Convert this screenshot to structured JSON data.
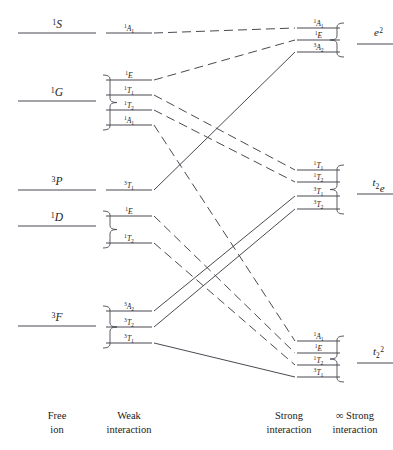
{
  "figure": {
    "line_color": "#4a4a52",
    "background": "#ffffff"
  },
  "captions": {
    "free_ion_l1": "Free",
    "free_ion_l2": "ion",
    "weak_l1": "Weak",
    "weak_l2": "interaction",
    "strong_l1": "Strong",
    "strong_l2": "interaction",
    "infinite_l1": "∞ Strong",
    "infinite_l2": "interaction"
  },
  "free_ion": [
    {
      "key": "S1",
      "mult": "1",
      "letter": "S",
      "label": "1S",
      "y": 33
    },
    {
      "key": "G1",
      "mult": "1",
      "letter": "G",
      "label": "1G",
      "y": 101
    },
    {
      "key": "P3",
      "mult": "3",
      "letter": "P",
      "label": "3P",
      "y": 190
    },
    {
      "key": "D1",
      "mult": "1",
      "letter": "D",
      "label": "1D",
      "y": 226
    },
    {
      "key": "F3",
      "mult": "3",
      "letter": "F",
      "label": "3F",
      "y": 326
    }
  ],
  "weak_field": [
    {
      "key": "w1",
      "mult": "1",
      "sym": "A",
      "sub": "1",
      "parent": "S1",
      "spin": "singlet",
      "y": 33
    },
    {
      "key": "w2",
      "mult": "1",
      "sym": "E",
      "sub": "",
      "parent": "G1",
      "spin": "singlet",
      "y": 80
    },
    {
      "key": "w3",
      "mult": "1",
      "sym": "T",
      "sub": "1",
      "parent": "G1",
      "spin": "singlet",
      "y": 95
    },
    {
      "key": "w4",
      "mult": "1",
      "sym": "T",
      "sub": "2",
      "parent": "G1",
      "spin": "singlet",
      "y": 110
    },
    {
      "key": "w5",
      "mult": "1",
      "sym": "A",
      "sub": "1",
      "parent": "G1",
      "spin": "singlet",
      "y": 125
    },
    {
      "key": "w6",
      "mult": "3",
      "sym": "T",
      "sub": "1",
      "parent": "P3",
      "spin": "triplet",
      "y": 190
    },
    {
      "key": "w7",
      "mult": "1",
      "sym": "E",
      "sub": "",
      "parent": "D1",
      "spin": "singlet",
      "y": 216
    },
    {
      "key": "w8",
      "mult": "1",
      "sym": "T",
      "sub": "2",
      "parent": "D1",
      "spin": "singlet",
      "y": 243
    },
    {
      "key": "w9",
      "mult": "3",
      "sym": "A",
      "sub": "2",
      "parent": "F3",
      "spin": "triplet",
      "y": 311
    },
    {
      "key": "w10",
      "mult": "3",
      "sym": "T",
      "sub": "2",
      "parent": "F3",
      "spin": "triplet",
      "y": 327
    },
    {
      "key": "w11",
      "mult": "3",
      "sym": "T",
      "sub": "1",
      "parent": "F3",
      "spin": "triplet",
      "y": 343
    }
  ],
  "strong_field": [
    {
      "key": "s1",
      "mult": "1",
      "sym": "A",
      "sub": "1",
      "config": "e2",
      "spin": "singlet",
      "y": 28
    },
    {
      "key": "s2",
      "mult": "1",
      "sym": "E",
      "sub": "",
      "config": "e2",
      "spin": "singlet",
      "y": 40
    },
    {
      "key": "s3",
      "mult": "3",
      "sym": "A",
      "sub": "2",
      "config": "e2",
      "spin": "triplet",
      "y": 52
    },
    {
      "key": "s4",
      "mult": "1",
      "sym": "T",
      "sub": "1",
      "config": "t2e",
      "spin": "singlet",
      "y": 170
    },
    {
      "key": "s5",
      "mult": "1",
      "sym": "T",
      "sub": "2",
      "config": "t2e",
      "spin": "singlet",
      "y": 182
    },
    {
      "key": "s6",
      "mult": "3",
      "sym": "T",
      "sub": "1",
      "config": "t2e",
      "spin": "triplet",
      "y": 196
    },
    {
      "key": "s7",
      "mult": "3",
      "sym": "T",
      "sub": "2",
      "config": "t2e",
      "spin": "triplet",
      "y": 209
    },
    {
      "key": "s8",
      "mult": "1",
      "sym": "A",
      "sub": "1",
      "config": "t22",
      "spin": "singlet",
      "y": 341
    },
    {
      "key": "s9",
      "mult": "1",
      "sym": "E",
      "sub": "",
      "config": "t22",
      "spin": "singlet",
      "y": 353
    },
    {
      "key": "s10",
      "mult": "1",
      "sym": "T",
      "sub": "2",
      "config": "t22",
      "spin": "singlet",
      "y": 365
    },
    {
      "key": "s11",
      "mult": "3",
      "sym": "T",
      "sub": "1",
      "config": "t22",
      "spin": "triplet",
      "y": 377
    }
  ],
  "configurations": [
    {
      "key": "e2",
      "base": "e",
      "sup": "2",
      "sub": "",
      "label": "e 2",
      "y": 40
    },
    {
      "key": "t2e",
      "base": "t",
      "sup": "",
      "sub": "2",
      "tail": "e",
      "label": "t2e",
      "y": 190
    },
    {
      "key": "t22",
      "base": "t",
      "sup": "2",
      "sub": "2",
      "label": "t2 2",
      "y": 359
    }
  ],
  "correlations": [
    {
      "from": "w1",
      "to": "s1",
      "style": "dashed"
    },
    {
      "from": "w2",
      "to": "s2",
      "style": "dashed"
    },
    {
      "from": "w3",
      "to": "s4",
      "style": "dashed"
    },
    {
      "from": "w4",
      "to": "s5",
      "style": "dashed"
    },
    {
      "from": "w5",
      "to": "s8",
      "style": "dashed"
    },
    {
      "from": "w6",
      "to": "s3",
      "style": "solid"
    },
    {
      "from": "w7",
      "to": "s9",
      "style": "dashed"
    },
    {
      "from": "w8",
      "to": "s10",
      "style": "dashed"
    },
    {
      "from": "w9",
      "to": "s6",
      "style": "solid"
    },
    {
      "from": "w10",
      "to": "s7",
      "style": "solid"
    },
    {
      "from": "w11",
      "to": "s11",
      "style": "solid"
    }
  ]
}
